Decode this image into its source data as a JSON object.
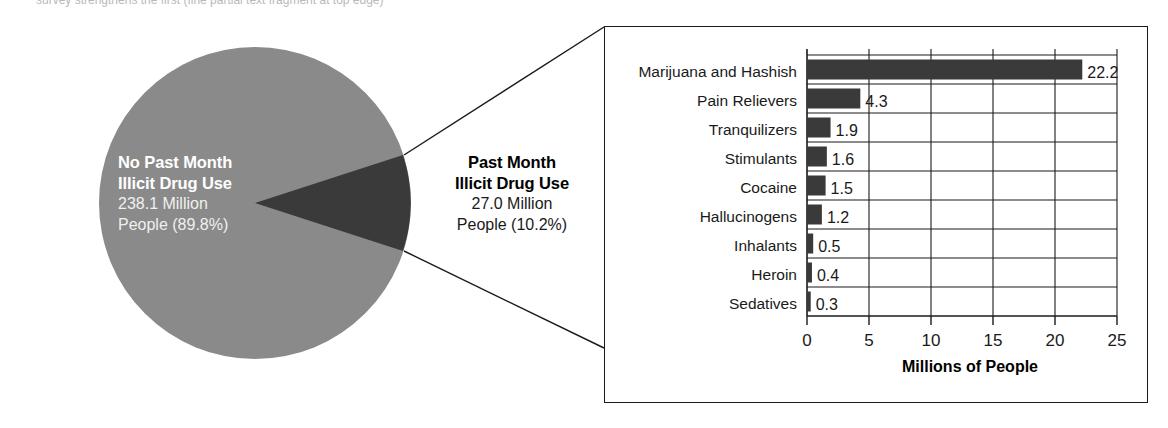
{
  "figure": {
    "bleed_text": "survey strengthens the first (fine partial text fragment at top edge)"
  },
  "pie": {
    "major": {
      "title_line1": "No Past Month",
      "title_line2": "Illicit Drug Use",
      "value_line1": "238.1 Million",
      "value_line2": "People (89.8%)"
    },
    "minor": {
      "title_line1": "Past Month",
      "title_line2": "Illicit Drug Use",
      "value_line1": "27.0 Million",
      "value_line2": "People (10.2%)"
    }
  },
  "chart_data": [
    {
      "type": "pie",
      "title": "Past Month Illicit Drug Use among Persons Aged 12 or Older",
      "labels": [
        "No Past Month Illicit Drug Use",
        "Past Month Illicit Drug Use"
      ],
      "values": [
        238.1,
        27.0
      ],
      "percents": [
        89.8,
        10.2
      ],
      "units": "Millions of People",
      "colors": [
        "#8a8a8a",
        "#3a3a3a"
      ],
      "legend": "none"
    },
    {
      "type": "bar",
      "orientation": "horizontal",
      "title": "",
      "categories": [
        "Marijuana and Hashish",
        "Pain Relievers",
        "Tranquilizers",
        "Stimulants",
        "Cocaine",
        "Hallucinogens",
        "Inhalants",
        "Heroin",
        "Sedatives"
      ],
      "values": [
        22.2,
        4.3,
        1.9,
        1.6,
        1.5,
        1.2,
        0.5,
        0.4,
        0.3
      ],
      "value_labels": [
        "22.2",
        "4.3",
        "1.9",
        "1.6",
        "1.5",
        "1.2",
        "0.5",
        "0.4",
        "0.3"
      ],
      "xlabel": "Millions of People",
      "ylabel": "",
      "xlim": [
        0,
        25
      ],
      "xticks": [
        0,
        5,
        10,
        15,
        20,
        25
      ],
      "xtick_labels": [
        "0",
        "5",
        "10",
        "15",
        "20",
        "25"
      ],
      "grid": "vertical-and-row-separators",
      "legend": "none",
      "bar_color": "#3a3a3a"
    }
  ],
  "colors": {
    "pie_major": "#8a8a8a",
    "pie_minor": "#3a3a3a",
    "bar_fill": "#3a3a3a",
    "axis": "#1a1a1a",
    "panel_border": "#1a1a1a"
  }
}
